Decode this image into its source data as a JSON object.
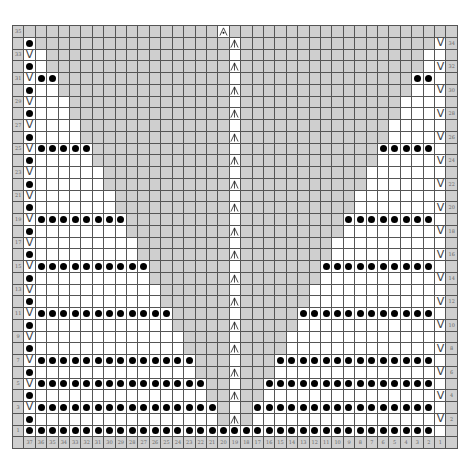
{
  "chart": {
    "colors": {
      "gray": "#cfcfcf",
      "white": "#ffffff",
      "grid": "#555555",
      "symbol": "#000000"
    },
    "legend_codes": {
      "g": "gray-no-stitch",
      "w": "white-knit",
      "d": "purl-dot",
      "v": "slip-stitch-v",
      "c": "central-double-decrease",
      "t": "top-bind-symbol"
    },
    "column_labels": [
      "37",
      "36",
      "35",
      "34",
      "33",
      "32",
      "31",
      "30",
      "29",
      "28",
      "27",
      "26",
      "25",
      "24",
      "23",
      "22",
      "21",
      "20",
      "19",
      "18",
      "17",
      "16",
      "15",
      "14",
      "13",
      "12",
      "11",
      "10",
      "9",
      "8",
      "7",
      "6",
      "5",
      "4",
      "3",
      "2",
      "1"
    ],
    "rows": [
      {
        "num": 35,
        "label_side": "left",
        "cells": "gggggggggggggggggtggggggggggggggggggg"
      },
      {
        "num": 34,
        "label_side": "right",
        "cells": "dgggggggggggggggggcgggggggggggggggggv"
      },
      {
        "num": 33,
        "label_side": "left",
        "cells": "vwggggggggggggggggwggggggggggggggggww"
      },
      {
        "num": 32,
        "label_side": "right",
        "cells": "dwggggggggggggggggcggggggggggggggggwv"
      },
      {
        "num": 31,
        "label_side": "left",
        "cells": "vddgggggggggggggggwgggggggggggggggddw"
      },
      {
        "num": 30,
        "label_side": "right",
        "cells": "dwwgggggggggggggggcgggggggggggggggwwv"
      },
      {
        "num": 29,
        "label_side": "left",
        "cells": "vwwwggggggggggggggwggggggggggggggwwww"
      },
      {
        "num": 28,
        "label_side": "right",
        "cells": "dwwwggggggggggggggcggggggggggggggwwwv"
      },
      {
        "num": 27,
        "label_side": "left",
        "cells": "vwwwwgggggggggggggwgggggggggggggwwwww"
      },
      {
        "num": 26,
        "label_side": "right",
        "cells": "dwwwwgggggggggggggcgggggggggggggwwwwv"
      },
      {
        "num": 25,
        "label_side": "left",
        "cells": "vdddddggggggggggggwggggggggggggdddddw"
      },
      {
        "num": 24,
        "label_side": "right",
        "cells": "dwwwwwggggggggggggcggggggggggggwwwwwv"
      },
      {
        "num": 23,
        "label_side": "left",
        "cells": "vwwwwwwgggggggggggwgggggggggggwwwwwww"
      },
      {
        "num": 22,
        "label_side": "right",
        "cells": "dwwwwwwgggggggggggcgggggggggggwwwwwwv"
      },
      {
        "num": 21,
        "label_side": "left",
        "cells": "vwwwwwwwggggggggggwggggggggggwwwwwwww"
      },
      {
        "num": 20,
        "label_side": "right",
        "cells": "dwwwwwwwggggggggggcggggggggggwwwwwwwv"
      },
      {
        "num": 19,
        "label_side": "left",
        "cells": "vddddddddgggggggggwgggggggggddddddddw"
      },
      {
        "num": 18,
        "label_side": "right",
        "cells": "dwwwwwwwwgggggggggcgggggggggwwwwwwwwv"
      },
      {
        "num": 17,
        "label_side": "left",
        "cells": "vwwwwwwwwwggggggggwggggggggwwwwwwwwww"
      },
      {
        "num": 16,
        "label_side": "right",
        "cells": "dwwwwwwwwwggggggggcggggggggwwwwwwwwwv"
      },
      {
        "num": 15,
        "label_side": "left",
        "cells": "vddddddddddgggggggwgggggggddddddddddw"
      },
      {
        "num": 14,
        "label_side": "right",
        "cells": "dwwwwwwwwwwgggggggcgggggggwwwwwwwwwwv"
      },
      {
        "num": 13,
        "label_side": "left",
        "cells": "vwwwwwwwwwwwggggggwggggggwwwwwwwwwwww"
      },
      {
        "num": 12,
        "label_side": "right",
        "cells": "dwwwwwwwwwwwggggggcggggggwwwwwwwwwwwv"
      },
      {
        "num": 11,
        "label_side": "left",
        "cells": "vddddddddddddgggggwgggggddddddddddddw"
      },
      {
        "num": 10,
        "label_side": "right",
        "cells": "dwwwwwwwwwwwwgggggcgggggwwwwwwwwwwwwv"
      },
      {
        "num": 9,
        "label_side": "left",
        "cells": "vwwwwwwwwwwwwwggggwggggwwwwwwwwwwwwww"
      },
      {
        "num": 8,
        "label_side": "right",
        "cells": "dwwwwwwwwwwwwwggggcggggwwwwwwwwwwwwwv"
      },
      {
        "num": 7,
        "label_side": "left",
        "cells": "vddddddddddddddgggwgggddddddddddddddw"
      },
      {
        "num": 6,
        "label_side": "right",
        "cells": "dwwwwwwwwwwwwwwgggcgggwwwwwwwwwwwwwwv"
      },
      {
        "num": 5,
        "label_side": "left",
        "cells": "vdddddddddddddddggwggdddddddddddddddw"
      },
      {
        "num": 4,
        "label_side": "right",
        "cells": "dwwwwwwwwwwwwwwwggcggwwwwwwwwwwwwwwwv"
      },
      {
        "num": 3,
        "label_side": "left",
        "cells": "vddddddddddddddddgwgddddddddddddddddw"
      },
      {
        "num": 2,
        "label_side": "right",
        "cells": "dwwwwwwwwwwwwwwwwgcgwwwwwwwwwwwwwwwwv"
      },
      {
        "num": 1,
        "label_side": "left",
        "cells": "ddddddddddddddddddddddddddddddddddddw"
      }
    ]
  }
}
